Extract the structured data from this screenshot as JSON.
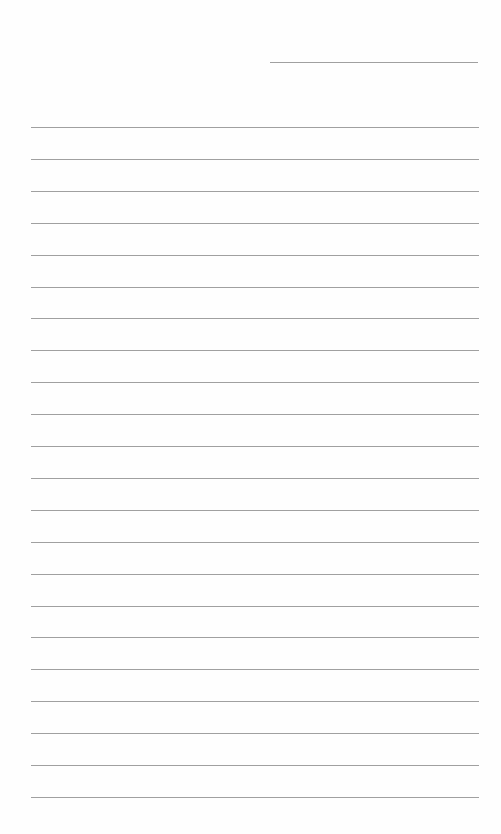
{
  "page": {
    "type": "lined-paper",
    "background_color": "#fefefe",
    "line_color": "#8f8f8f",
    "header_line": {
      "x": 270,
      "y": 62,
      "width": 208
    },
    "ruled_lines": {
      "count": 22,
      "start_y": 127,
      "spacing": 31.9,
      "left": 31,
      "width": 448
    }
  }
}
